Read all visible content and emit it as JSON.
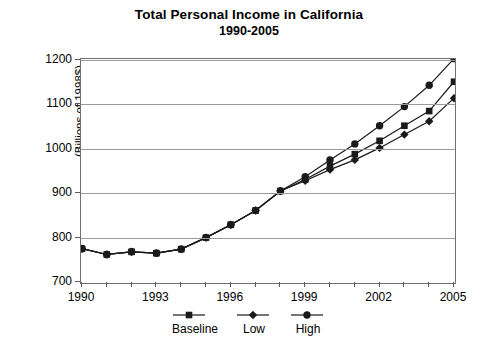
{
  "title": {
    "line1": "Total Personal Income in California",
    "line2": "1990-2005"
  },
  "axes": {
    "ylabel": "(Billions of 1998$)",
    "yticks": [
      "1200",
      "1100",
      "1000",
      "900",
      "800",
      "700"
    ],
    "xticks": [
      "1990",
      "1993",
      "1996",
      "1999",
      "2002",
      "2005"
    ]
  },
  "legend": {
    "items": [
      {
        "label": "Baseline",
        "marker": "square-marker",
        "color": "#1a1a1a"
      },
      {
        "label": "Low",
        "marker": "diamond-marker",
        "color": "#1a1a1a"
      },
      {
        "label": "High",
        "marker": "circle-marker",
        "color": "#1a1a1a"
      }
    ]
  },
  "chart_data": {
    "type": "line",
    "title": "Total Personal Income in California 1990-2005",
    "xlabel": "",
    "ylabel": "(Billions of 1998$)",
    "xlim": [
      1990,
      2005
    ],
    "ylim": [
      700,
      1200
    ],
    "ytick_step": 100,
    "xtick_step": 3,
    "grid": "horizontal",
    "legend_position": "bottom",
    "x": [
      1990,
      1991,
      1992,
      1993,
      1994,
      1995,
      1996,
      1997,
      1998,
      1999,
      2000,
      2001,
      2002,
      2003,
      2004,
      2005
    ],
    "series": [
      {
        "name": "Baseline",
        "marker": "square",
        "color": "#1a1a1a",
        "values": [
          775,
          762,
          768,
          765,
          774,
          800,
          829,
          861,
          905,
          931,
          961,
          988,
          1018,
          1052,
          1085,
          1151
        ]
      },
      {
        "name": "Low",
        "marker": "diamond",
        "color": "#1a1a1a",
        "values": [
          775,
          762,
          768,
          765,
          774,
          800,
          829,
          861,
          905,
          928,
          953,
          975,
          1002,
          1032,
          1062,
          1114
        ]
      },
      {
        "name": "High",
        "marker": "circle",
        "color": "#1a1a1a",
        "values": [
          775,
          762,
          768,
          765,
          774,
          800,
          829,
          861,
          905,
          937,
          975,
          1011,
          1052,
          1095,
          1143,
          1203
        ]
      }
    ]
  }
}
